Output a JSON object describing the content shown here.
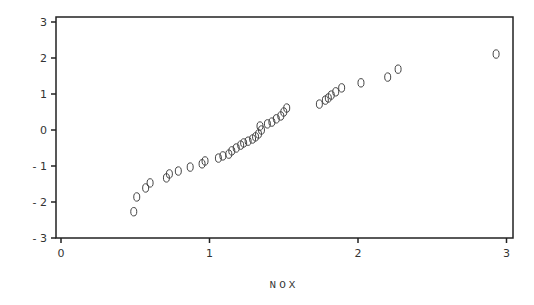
{
  "chart_data": {
    "type": "scatter",
    "title": "",
    "xlabel": "NOX",
    "ylabel": "",
    "xlim": [
      0,
      3
    ],
    "ylim": [
      -3,
      3
    ],
    "x_ticks": [
      "0",
      "1",
      "2",
      "3"
    ],
    "y_ticks": [
      "3",
      "2",
      "1",
      "0",
      "-1",
      "-2",
      "-3"
    ],
    "grid": false,
    "legend": null,
    "marker": "o",
    "points": [
      {
        "x": 0.49,
        "y": -2.27
      },
      {
        "x": 0.51,
        "y": -1.86
      },
      {
        "x": 0.57,
        "y": -1.61
      },
      {
        "x": 0.6,
        "y": -1.47
      },
      {
        "x": 0.71,
        "y": -1.33
      },
      {
        "x": 0.73,
        "y": -1.22
      },
      {
        "x": 0.79,
        "y": -1.14
      },
      {
        "x": 0.87,
        "y": -1.03
      },
      {
        "x": 0.95,
        "y": -0.94
      },
      {
        "x": 0.97,
        "y": -0.86
      },
      {
        "x": 1.06,
        "y": -0.78
      },
      {
        "x": 1.09,
        "y": -0.72
      },
      {
        "x": 1.13,
        "y": -0.67
      },
      {
        "x": 1.15,
        "y": -0.58
      },
      {
        "x": 1.18,
        "y": -0.5
      },
      {
        "x": 1.21,
        "y": -0.42
      },
      {
        "x": 1.23,
        "y": -0.36
      },
      {
        "x": 1.26,
        "y": -0.31
      },
      {
        "x": 1.29,
        "y": -0.25
      },
      {
        "x": 1.31,
        "y": -0.19
      },
      {
        "x": 1.33,
        "y": -0.11
      },
      {
        "x": 1.35,
        "y": 0.0
      },
      {
        "x": 1.34,
        "y": 0.11
      },
      {
        "x": 1.39,
        "y": 0.17
      },
      {
        "x": 1.42,
        "y": 0.22
      },
      {
        "x": 1.45,
        "y": 0.31
      },
      {
        "x": 1.48,
        "y": 0.39
      },
      {
        "x": 1.5,
        "y": 0.5
      },
      {
        "x": 1.52,
        "y": 0.61
      },
      {
        "x": 1.74,
        "y": 0.72
      },
      {
        "x": 1.78,
        "y": 0.83
      },
      {
        "x": 1.8,
        "y": 0.89
      },
      {
        "x": 1.82,
        "y": 0.97
      },
      {
        "x": 1.85,
        "y": 1.06
      },
      {
        "x": 1.89,
        "y": 1.17
      },
      {
        "x": 2.02,
        "y": 1.31
      },
      {
        "x": 2.2,
        "y": 1.47
      },
      {
        "x": 2.27,
        "y": 1.69
      },
      {
        "x": 2.93,
        "y": 2.11
      }
    ]
  },
  "colors": {
    "axis": "#222222",
    "text": "#333333",
    "marker": "#444444",
    "background": "#ffffff"
  }
}
